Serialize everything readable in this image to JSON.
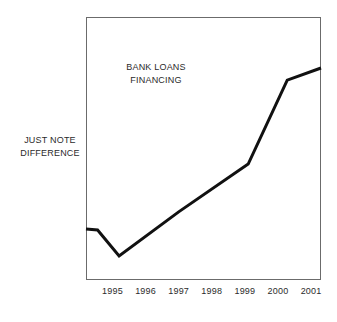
{
  "chart_data": {
    "type": "line",
    "title": "BANK LOANS FINANCING",
    "title_lines": [
      "BANK LOANS",
      "FINANCING"
    ],
    "annotation": "JUST NOTE DIFFERENCE",
    "annotation_lines": [
      "JUST NOTE",
      "DIFFERENCE"
    ],
    "annotation_position": "left-of-axis",
    "xlabel": "",
    "ylabel": "",
    "grid": false,
    "legend": false,
    "axis_ticks_visible": false,
    "y_axis_labels_visible": false,
    "xlim": [
      1994.2,
      2001.3
    ],
    "ylim": [
      0,
      100
    ],
    "categories": [
      "1995",
      "1996",
      "1997",
      "1998",
      "1999",
      "2000",
      "2001"
    ],
    "tick_values": [
      1995,
      1996,
      1997,
      1998,
      1999,
      2000,
      2001
    ],
    "series": [
      {
        "name": "BANK LOANS FINANCING",
        "color": "#111111",
        "line_width": 3,
        "x": [
          1994.2,
          1994.55,
          1995.2,
          1997.0,
          1999.1,
          2000.28,
          2001.3
        ],
        "values": [
          19.4,
          19.0,
          9.1,
          25.9,
          44.1,
          76.0,
          80.6
        ],
        "points": [
          {
            "x": 1994.2,
            "y": 19.4,
            "note": "start, flat"
          },
          {
            "x": 1994.55,
            "y": 19.0,
            "note": "end of flat start"
          },
          {
            "x": 1995.2,
            "y": 9.1,
            "note": "trough / minimum"
          },
          {
            "x": 1997.0,
            "y": 25.9,
            "note": "bend, slope eases"
          },
          {
            "x": 1999.1,
            "y": 44.1,
            "note": "bend, steep rise begins"
          },
          {
            "x": 2000.28,
            "y": 76.0,
            "note": "knee, top of steep rise"
          },
          {
            "x": 2001.3,
            "y": 80.6,
            "note": "endpoint / maximum"
          }
        ]
      }
    ]
  },
  "figure": {
    "background": "#ffffff",
    "frame_color": "#6b6b6b",
    "text_color": "#2b2b2b"
  }
}
